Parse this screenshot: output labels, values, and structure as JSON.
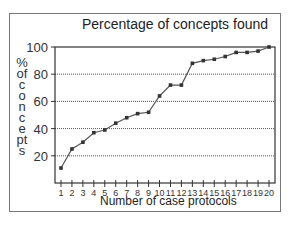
{
  "chart_data": {
    "type": "line",
    "title": "Percentage of concepts found",
    "xlabel": "Number of case protocols",
    "ylabel": "% of concepts",
    "x": [
      1,
      2,
      3,
      4,
      5,
      6,
      7,
      8,
      9,
      10,
      11,
      12,
      13,
      14,
      15,
      16,
      17,
      18,
      19,
      20
    ],
    "series": [
      {
        "name": "Percentage of concepts found",
        "values": [
          11,
          25,
          30,
          37,
          39,
          44,
          48,
          51,
          52,
          64,
          72,
          72,
          88,
          90,
          91,
          93,
          96,
          96,
          97,
          100
        ]
      }
    ],
    "ylim": [
      0,
      100
    ],
    "yticks": [
      20,
      40,
      60,
      80,
      100
    ],
    "grid": "horizontal dotted",
    "legend": "none",
    "colors": {
      "line": "#555555",
      "marker": "#333333",
      "grid": "#555555"
    }
  }
}
